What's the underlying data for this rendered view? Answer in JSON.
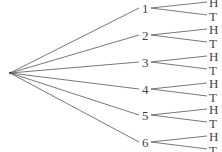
{
  "diagram": {
    "type": "tree",
    "root": {
      "x": 10,
      "y": 73
    },
    "level1": [
      {
        "label": "1",
        "x": 143,
        "y": 8
      },
      {
        "label": "2",
        "x": 143,
        "y": 35
      },
      {
        "label": "3",
        "x": 143,
        "y": 62
      },
      {
        "label": "4",
        "x": 143,
        "y": 89
      },
      {
        "label": "5",
        "x": 143,
        "y": 115
      },
      {
        "label": "6",
        "x": 143,
        "y": 142
      }
    ],
    "level2_labels": [
      "H",
      "T"
    ],
    "line_color": "#555555",
    "text_color": "#444444"
  }
}
